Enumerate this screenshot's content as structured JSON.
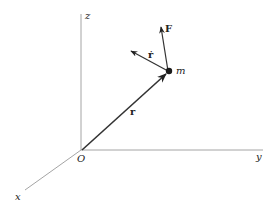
{
  "diagram": {
    "axes": {
      "z_label": "z",
      "y_label": "y",
      "x_label": "x",
      "origin_label": "O"
    },
    "vectors": {
      "position_label": "r",
      "velocity_label": "ṙ",
      "force_label": "F"
    },
    "particle_label": "m",
    "colors": {
      "axis": "#9a9a9a",
      "vector": "#333333",
      "particle": "#1a1a1a"
    }
  }
}
